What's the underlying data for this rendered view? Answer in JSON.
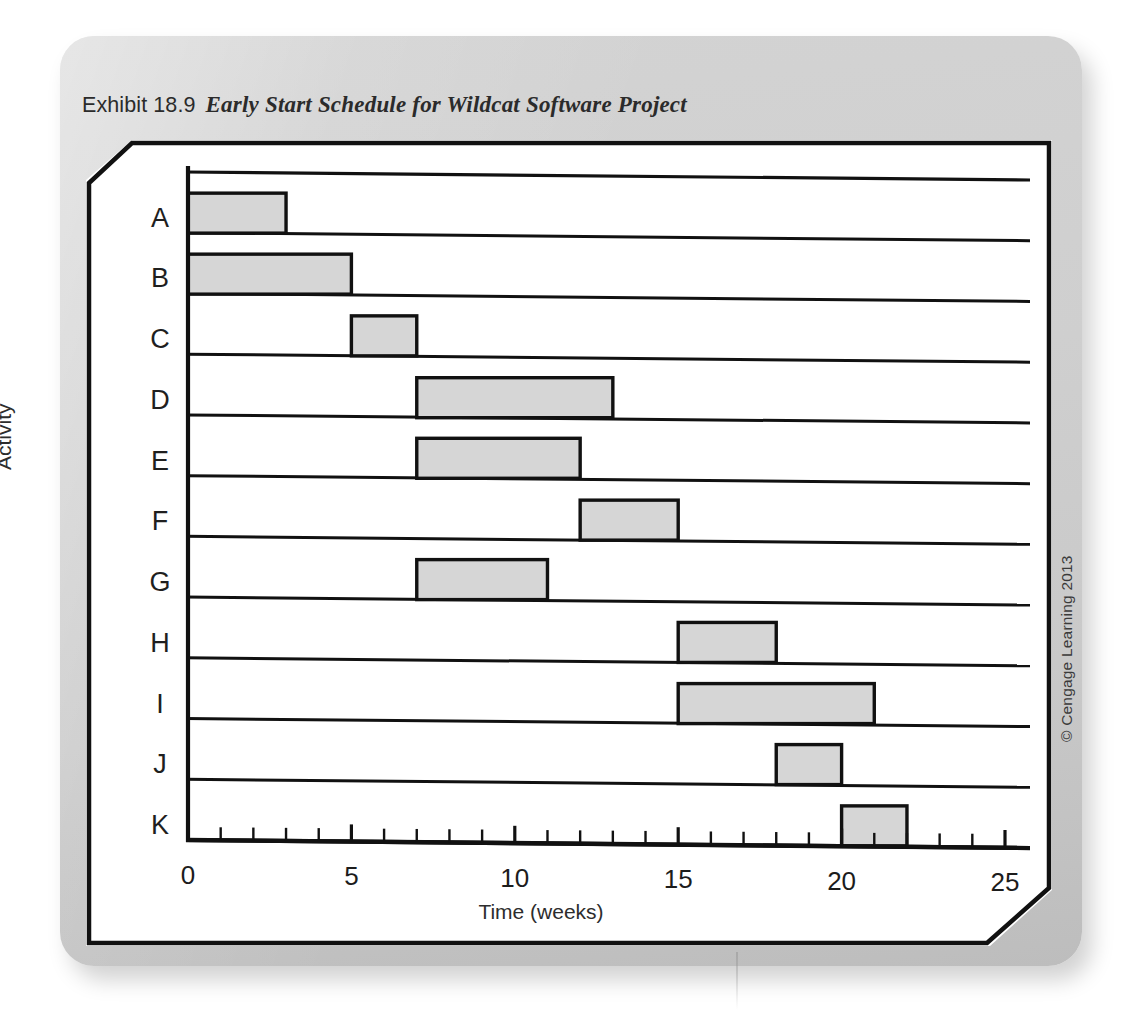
{
  "exhibit": {
    "label": "Exhibit 18.9",
    "title": "Early Start Schedule for Wildcat Software Project"
  },
  "copyright": "© Cengage Learning 2013",
  "chart_data": {
    "type": "bar",
    "orientation": "horizontal",
    "subtype": "gantt",
    "title": "Early Start Schedule for Wildcat Software Project",
    "xlabel": "Time (weeks)",
    "ylabel": "Activity",
    "xlim": [
      0,
      25
    ],
    "xticks": [
      0,
      5,
      10,
      15,
      20,
      25
    ],
    "xtick_labels": [
      "0",
      "5",
      "10",
      "15",
      "20",
      "25"
    ],
    "minor_tick_step": 1,
    "grid": false,
    "row_baselines": true,
    "legend": null,
    "categories": [
      "A",
      "B",
      "C",
      "D",
      "E",
      "F",
      "G",
      "H",
      "I",
      "J",
      "K"
    ],
    "bar_fill": "#d6d6d6",
    "bar_stroke": "#111111",
    "tasks": [
      {
        "activity": "A",
        "start": 0,
        "finish": 3,
        "duration": 3
      },
      {
        "activity": "B",
        "start": 0,
        "finish": 5,
        "duration": 5
      },
      {
        "activity": "C",
        "start": 5,
        "finish": 7,
        "duration": 2
      },
      {
        "activity": "D",
        "start": 7,
        "finish": 13,
        "duration": 6
      },
      {
        "activity": "E",
        "start": 7,
        "finish": 12,
        "duration": 5
      },
      {
        "activity": "F",
        "start": 12,
        "finish": 15,
        "duration": 3
      },
      {
        "activity": "G",
        "start": 7,
        "finish": 11,
        "duration": 4
      },
      {
        "activity": "H",
        "start": 15,
        "finish": 18,
        "duration": 3
      },
      {
        "activity": "I",
        "start": 15,
        "finish": 21,
        "duration": 6
      },
      {
        "activity": "J",
        "start": 18,
        "finish": 20,
        "duration": 2
      },
      {
        "activity": "K",
        "start": 20,
        "finish": 22,
        "duration": 2
      }
    ]
  }
}
